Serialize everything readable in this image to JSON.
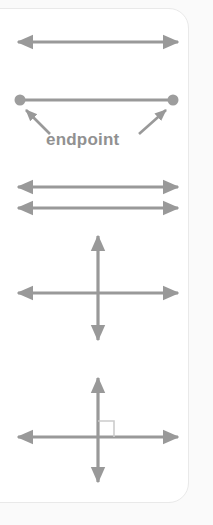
{
  "panel": {
    "title": "Geometry terms illustration panel",
    "background_color": "#fafafa",
    "card_color": "#ffffff",
    "card_border_color": "#e9e9e9",
    "stroke_color": "#999999",
    "label_color": "#919191",
    "right_angle_marker_color": "#cccccc"
  },
  "labels": {
    "endpoint": "endpoint"
  },
  "figures": [
    {
      "id": "line",
      "name": "line",
      "description": "Double-headed arrow representing a line",
      "arrowheads": "both",
      "orientation": "horizontal",
      "y": 42,
      "x_start": 18,
      "x_end": 178
    },
    {
      "id": "line-segment",
      "name": "line segment with endpoints",
      "description": "Segment capped by two round endpoint dots, annotated by two pointer arrows",
      "arrowheads": "none",
      "orientation": "horizontal",
      "y": 100,
      "x_start": 20,
      "x_end": 173,
      "endpoint_dot_radius": 5.5,
      "callout_label": "endpoint",
      "callout_count": 2
    },
    {
      "id": "parallel-lines",
      "name": "parallel lines",
      "description": "Two parallel double-headed arrows",
      "arrowheads": "both",
      "orientation": "horizontal",
      "lines": [
        {
          "y": 187,
          "x_start": 18,
          "x_end": 178
        },
        {
          "y": 208,
          "x_start": 18,
          "x_end": 178
        }
      ]
    },
    {
      "id": "intersecting-lines",
      "name": "intersecting lines",
      "description": "Two double-headed arrows crossing at a point",
      "arrowheads": "both",
      "horizontal": {
        "y": 293,
        "x_start": 18,
        "x_end": 178
      },
      "vertical": {
        "x": 98,
        "y_start": 236,
        "y_end": 340
      }
    },
    {
      "id": "perpendicular-lines",
      "name": "perpendicular lines",
      "description": "Two double-headed arrows crossing at a right angle, marked with a right-angle square",
      "arrowheads": "both",
      "horizontal": {
        "y": 437,
        "x_start": 18,
        "x_end": 178
      },
      "vertical": {
        "x": 98,
        "y_start": 378,
        "y_end": 482
      },
      "right_angle_marker": {
        "x": 98,
        "y": 437,
        "size": 16,
        "quadrant": "upper-right"
      }
    }
  ]
}
